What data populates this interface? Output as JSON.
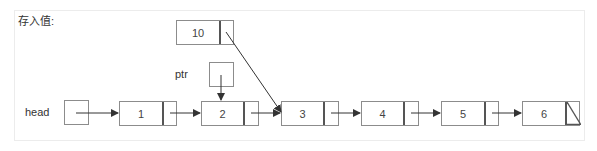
{
  "title": "存入值:",
  "labels": {
    "head": "head",
    "ptr": "ptr"
  },
  "list": {
    "nodes": [
      {
        "value": "1"
      },
      {
        "value": "2"
      },
      {
        "value": "3"
      },
      {
        "value": "4"
      },
      {
        "value": "5"
      },
      {
        "value": "6",
        "next": "null"
      }
    ]
  },
  "new_node": {
    "value": "10",
    "next": "3"
  },
  "ptr_target": "2",
  "colors": {
    "border": "#8c8c8c",
    "arrow": "#333333",
    "panel_border": "#ececec"
  }
}
